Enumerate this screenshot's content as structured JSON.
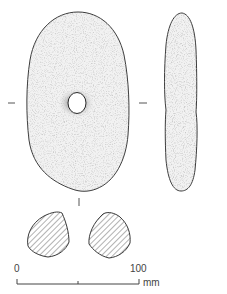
{
  "figure": {
    "views": {
      "front": {
        "label": "front-view"
      },
      "side": {
        "label": "side-profile"
      },
      "sections": [
        "section-left",
        "section-right"
      ]
    },
    "colors": {
      "outline": "#3a3a3a",
      "stipple": "#8a8a8a",
      "hatch": "#555555",
      "background": "#ffffff"
    }
  },
  "scale_bar": {
    "start_label": "0",
    "end_label": "100",
    "unit": "mm"
  }
}
